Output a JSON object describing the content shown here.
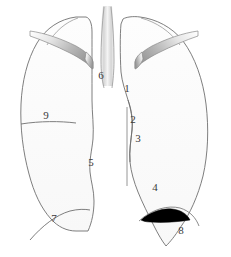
{
  "figure": {
    "type": "anatomical-line-diagram",
    "background_color": "#ffffff",
    "outline_color": "#6b6b6b",
    "lung_fill_color": "#fcfcfc",
    "clavicle_fill_color": "#c9c9c9",
    "effusion_color": "#000000",
    "label_color": "#3a3a3a"
  },
  "labels": [
    {
      "id": "1",
      "text": "1",
      "x": 127,
      "y": 92,
      "refers_to": "right-mediastinal-border-upper"
    },
    {
      "id": "2",
      "text": "2",
      "x": 133,
      "y": 123,
      "refers_to": "right-mediastinal-border-middle"
    },
    {
      "id": "3",
      "text": "3",
      "x": 138,
      "y": 142,
      "refers_to": "right-heart-border"
    },
    {
      "id": "4",
      "text": "4",
      "x": 155,
      "y": 191,
      "refers_to": "right-cardiophrenic-angle"
    },
    {
      "id": "5",
      "text": "5",
      "x": 91,
      "y": 166,
      "refers_to": "left-mediastinal-border"
    },
    {
      "id": "6",
      "text": "6",
      "x": 101,
      "y": 79,
      "refers_to": "trachea"
    },
    {
      "id": "7",
      "text": "7",
      "x": 54,
      "y": 222,
      "refers_to": "left-hemidiaphragm"
    },
    {
      "id": "8",
      "text": "8",
      "x": 181,
      "y": 234,
      "refers_to": "pleural-effusion"
    },
    {
      "id": "9",
      "text": "9",
      "x": 46,
      "y": 119,
      "refers_to": "horizontal-fissure"
    }
  ],
  "structures": [
    {
      "name": "left-lung-field",
      "side": "left"
    },
    {
      "name": "right-lung-field",
      "side": "right"
    },
    {
      "name": "left-clavicle",
      "side": "left"
    },
    {
      "name": "right-clavicle",
      "side": "right"
    },
    {
      "name": "trachea",
      "side": "center"
    },
    {
      "name": "spine-line",
      "side": "center"
    },
    {
      "name": "horizontal-fissure",
      "side": "left"
    },
    {
      "name": "pleural-effusion",
      "side": "right"
    }
  ]
}
